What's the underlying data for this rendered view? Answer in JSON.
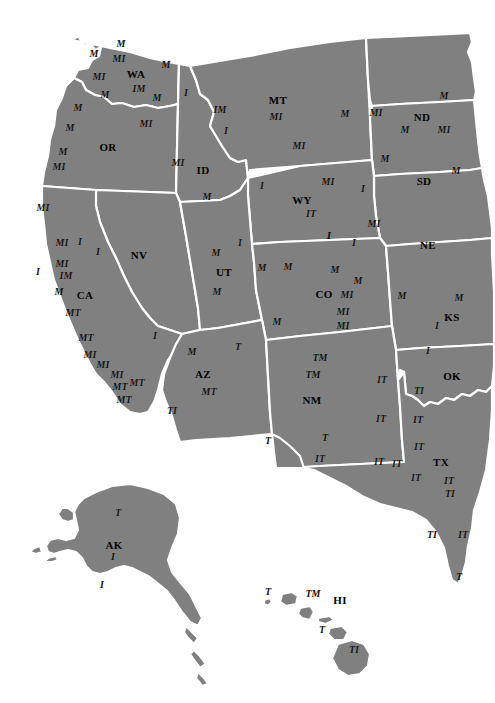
{
  "map": {
    "title": "Western United States Map",
    "colors": {
      "land_fill": "#808080",
      "border_stroke": "#ffffff",
      "background": "#ffffff",
      "label_color": "#141414",
      "state_label_color": "#000000"
    },
    "state_labels": [
      {
        "abbr": "WA",
        "x": 136,
        "y": 74,
        "size": 11
      },
      {
        "abbr": "OR",
        "x": 108,
        "y": 147,
        "size": 11
      },
      {
        "abbr": "ID",
        "x": 203,
        "y": 170,
        "size": 11
      },
      {
        "abbr": "MT",
        "x": 278,
        "y": 100,
        "size": 11
      },
      {
        "abbr": "ND",
        "x": 422,
        "y": 117,
        "size": 11
      },
      {
        "abbr": "SD",
        "x": 424,
        "y": 181,
        "size": 11
      },
      {
        "abbr": "NE",
        "x": 428,
        "y": 245,
        "size": 11
      },
      {
        "abbr": "WY",
        "x": 302,
        "y": 200,
        "size": 11
      },
      {
        "abbr": "NV",
        "x": 139,
        "y": 255,
        "size": 11
      },
      {
        "abbr": "UT",
        "x": 224,
        "y": 272,
        "size": 11
      },
      {
        "abbr": "CO",
        "x": 324,
        "y": 294,
        "size": 11
      },
      {
        "abbr": "KS",
        "x": 452,
        "y": 317,
        "size": 11
      },
      {
        "abbr": "CA",
        "x": 85,
        "y": 295,
        "size": 11
      },
      {
        "abbr": "AZ",
        "x": 203,
        "y": 374,
        "size": 11
      },
      {
        "abbr": "NM",
        "x": 312,
        "y": 400,
        "size": 11
      },
      {
        "abbr": "OK",
        "x": 452,
        "y": 376,
        "size": 11
      },
      {
        "abbr": "TX",
        "x": 441,
        "y": 462,
        "size": 11
      },
      {
        "abbr": "AK",
        "x": 114,
        "y": 545,
        "size": 11
      },
      {
        "abbr": "HI",
        "x": 340,
        "y": 600,
        "size": 11
      }
    ],
    "markers": [
      {
        "text": "M",
        "x": 94,
        "y": 54,
        "size": 10
      },
      {
        "text": "M",
        "x": 121,
        "y": 44,
        "size": 10
      },
      {
        "text": "MI",
        "x": 119,
        "y": 59,
        "size": 10
      },
      {
        "text": "M",
        "x": 166,
        "y": 65,
        "size": 10
      },
      {
        "text": "MI",
        "x": 99,
        "y": 77,
        "size": 10
      },
      {
        "text": "IM",
        "x": 139,
        "y": 89,
        "size": 10
      },
      {
        "text": "M",
        "x": 105,
        "y": 95,
        "size": 10
      },
      {
        "text": "M",
        "x": 157,
        "y": 98,
        "size": 10
      },
      {
        "text": "M",
        "x": 78,
        "y": 108,
        "size": 10
      },
      {
        "text": "M",
        "x": 70,
        "y": 128,
        "size": 10
      },
      {
        "text": "MI",
        "x": 146,
        "y": 124,
        "size": 10
      },
      {
        "text": "M",
        "x": 63,
        "y": 152,
        "size": 10
      },
      {
        "text": "MI",
        "x": 59,
        "y": 167,
        "size": 10
      },
      {
        "text": "MI",
        "x": 43,
        "y": 208,
        "size": 10
      },
      {
        "text": "I",
        "x": 186,
        "y": 93,
        "size": 10
      },
      {
        "text": "IM",
        "x": 220,
        "y": 110,
        "size": 10
      },
      {
        "text": "I",
        "x": 226,
        "y": 131,
        "size": 10
      },
      {
        "text": "MI",
        "x": 178,
        "y": 163,
        "size": 10
      },
      {
        "text": "M",
        "x": 207,
        "y": 197,
        "size": 10
      },
      {
        "text": "MI",
        "x": 276,
        "y": 117,
        "size": 10
      },
      {
        "text": "M",
        "x": 345,
        "y": 114,
        "size": 10
      },
      {
        "text": "MI",
        "x": 299,
        "y": 146,
        "size": 10
      },
      {
        "text": "M",
        "x": 444,
        "y": 96,
        "size": 10
      },
      {
        "text": "MI",
        "x": 376,
        "y": 113,
        "size": 10
      },
      {
        "text": "M",
        "x": 405,
        "y": 130,
        "size": 10
      },
      {
        "text": "MI",
        "x": 444,
        "y": 130,
        "size": 10
      },
      {
        "text": "M",
        "x": 385,
        "y": 159,
        "size": 10
      },
      {
        "text": "M",
        "x": 456,
        "y": 171,
        "size": 10
      },
      {
        "text": "I",
        "x": 363,
        "y": 189,
        "size": 10
      },
      {
        "text": "MI",
        "x": 374,
        "y": 224,
        "size": 10
      },
      {
        "text": "I",
        "x": 354,
        "y": 243,
        "size": 10
      },
      {
        "text": "I",
        "x": 262,
        "y": 186,
        "size": 10
      },
      {
        "text": "MI",
        "x": 328,
        "y": 182,
        "size": 10
      },
      {
        "text": "IT",
        "x": 311,
        "y": 214,
        "size": 10
      },
      {
        "text": "I",
        "x": 329,
        "y": 236,
        "size": 10
      },
      {
        "text": "I",
        "x": 329,
        "y": 236,
        "size": 10
      },
      {
        "text": "I",
        "x": 240,
        "y": 243,
        "size": 10
      },
      {
        "text": "MI",
        "x": 62,
        "y": 243,
        "size": 10
      },
      {
        "text": "I",
        "x": 80,
        "y": 242,
        "size": 10
      },
      {
        "text": "I",
        "x": 98,
        "y": 252,
        "size": 10
      },
      {
        "text": "MI",
        "x": 62,
        "y": 264,
        "size": 10
      },
      {
        "text": "IM",
        "x": 66,
        "y": 276,
        "size": 10
      },
      {
        "text": "I",
        "x": 38,
        "y": 272,
        "size": 10
      },
      {
        "text": "M",
        "x": 59,
        "y": 292,
        "size": 10
      },
      {
        "text": "MT",
        "x": 73,
        "y": 313,
        "size": 10
      },
      {
        "text": "MT",
        "x": 86,
        "y": 338,
        "size": 10
      },
      {
        "text": "I",
        "x": 155,
        "y": 336,
        "size": 10
      },
      {
        "text": "MI",
        "x": 90,
        "y": 355,
        "size": 10
      },
      {
        "text": "MI",
        "x": 103,
        "y": 365,
        "size": 10
      },
      {
        "text": "MI",
        "x": 117,
        "y": 375,
        "size": 10
      },
      {
        "text": "MT",
        "x": 137,
        "y": 383,
        "size": 10
      },
      {
        "text": "MT",
        "x": 120,
        "y": 387,
        "size": 10
      },
      {
        "text": "MT",
        "x": 124,
        "y": 400,
        "size": 10
      },
      {
        "text": "TI",
        "x": 172,
        "y": 411,
        "size": 10
      },
      {
        "text": "M",
        "x": 216,
        "y": 253,
        "size": 10
      },
      {
        "text": "M",
        "x": 217,
        "y": 292,
        "size": 10
      },
      {
        "text": "M",
        "x": 262,
        "y": 268,
        "size": 10
      },
      {
        "text": "M",
        "x": 277,
        "y": 322,
        "size": 10
      },
      {
        "text": "M",
        "x": 288,
        "y": 267,
        "size": 10
      },
      {
        "text": "M",
        "x": 335,
        "y": 270,
        "size": 10
      },
      {
        "text": "M",
        "x": 358,
        "y": 281,
        "size": 10
      },
      {
        "text": "MI",
        "x": 347,
        "y": 295,
        "size": 10
      },
      {
        "text": "MI",
        "x": 343,
        "y": 312,
        "size": 10
      },
      {
        "text": "MI",
        "x": 343,
        "y": 326,
        "size": 10
      },
      {
        "text": "M",
        "x": 402,
        "y": 296,
        "size": 10
      },
      {
        "text": "M",
        "x": 459,
        "y": 298,
        "size": 10
      },
      {
        "text": "I",
        "x": 437,
        "y": 326,
        "size": 10
      },
      {
        "text": "I",
        "x": 428,
        "y": 351,
        "size": 10
      },
      {
        "text": "M",
        "x": 192,
        "y": 352,
        "size": 10
      },
      {
        "text": "T",
        "x": 238,
        "y": 347,
        "size": 10
      },
      {
        "text": "MT",
        "x": 209,
        "y": 392,
        "size": 10
      },
      {
        "text": "TM",
        "x": 320,
        "y": 358,
        "size": 10
      },
      {
        "text": "TM",
        "x": 313,
        "y": 375,
        "size": 10
      },
      {
        "text": "T",
        "x": 268,
        "y": 441,
        "size": 10
      },
      {
        "text": "T",
        "x": 325,
        "y": 438,
        "size": 10
      },
      {
        "text": "IT",
        "x": 320,
        "y": 459,
        "size": 10
      },
      {
        "text": "IT",
        "x": 382,
        "y": 380,
        "size": 10
      },
      {
        "text": "TI",
        "x": 419,
        "y": 391,
        "size": 10
      },
      {
        "text": "IT",
        "x": 381,
        "y": 419,
        "size": 10
      },
      {
        "text": "IT",
        "x": 418,
        "y": 420,
        "size": 10
      },
      {
        "text": "IT",
        "x": 419,
        "y": 447,
        "size": 10
      },
      {
        "text": "IT",
        "x": 379,
        "y": 462,
        "size": 10
      },
      {
        "text": "IT",
        "x": 397,
        "y": 464,
        "size": 10
      },
      {
        "text": "IT",
        "x": 416,
        "y": 478,
        "size": 10
      },
      {
        "text": "IT",
        "x": 449,
        "y": 481,
        "size": 10
      },
      {
        "text": "TI",
        "x": 450,
        "y": 494,
        "size": 10
      },
      {
        "text": "TI",
        "x": 432,
        "y": 535,
        "size": 10
      },
      {
        "text": "IT",
        "x": 463,
        "y": 535,
        "size": 10
      },
      {
        "text": "T",
        "x": 459,
        "y": 577,
        "size": 10
      },
      {
        "text": "T",
        "x": 118,
        "y": 513,
        "size": 10
      },
      {
        "text": "I",
        "x": 113,
        "y": 557,
        "size": 10
      },
      {
        "text": "I",
        "x": 102,
        "y": 585,
        "size": 10
      },
      {
        "text": "T",
        "x": 268,
        "y": 592,
        "size": 10
      },
      {
        "text": "TM",
        "x": 313,
        "y": 594,
        "size": 10
      },
      {
        "text": "T",
        "x": 322,
        "y": 630,
        "size": 10
      },
      {
        "text": "TI",
        "x": 354,
        "y": 650,
        "size": 10
      }
    ]
  }
}
